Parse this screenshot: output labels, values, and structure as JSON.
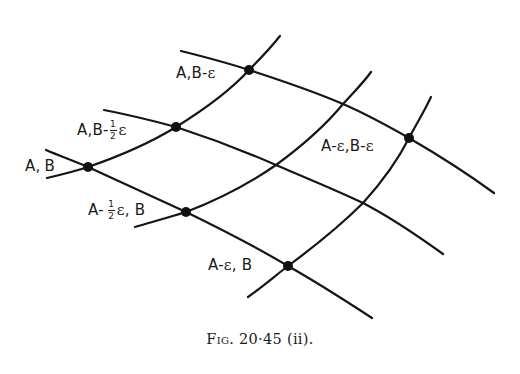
{
  "figure": {
    "caption_prefix": "Fig.",
    "caption_number": "20·45 (ii).",
    "caption_full": "Fig. 20·45 (ii).",
    "stroke_color": "#151515",
    "background_color": "#ffffff"
  },
  "labels": {
    "ab": {
      "a": "A",
      "sep": ",",
      "b": "B"
    },
    "ab_half_eps": {
      "prefix": "A,B-",
      "num": "1",
      "den": "2",
      "eps": "ε"
    },
    "ab_eps": {
      "prefix": "A,B-",
      "eps": "ε"
    },
    "a_half_eps_b": {
      "prefix": "A-",
      "num": "1",
      "den": "2",
      "eps": "ε",
      "suffix": ", B"
    },
    "a_eps_b": {
      "prefix": "A-",
      "eps": "ε",
      "suffix": ", B"
    },
    "a_eps_b_eps": {
      "prefix": "A-",
      "eps1": "ε",
      "mid": ",B-",
      "eps2": "ε"
    }
  },
  "points": [
    {
      "id": "A,B",
      "x": 88,
      "y": 167
    },
    {
      "id": "A,B-½ε",
      "x": 176,
      "y": 127
    },
    {
      "id": "A,B-ε",
      "x": 249,
      "y": 70
    },
    {
      "id": "A-½ε,B",
      "x": 186,
      "y": 212
    },
    {
      "id": "A-ε,B",
      "x": 288,
      "y": 266
    },
    {
      "id": "A-ε,B-ε",
      "x": 409,
      "y": 138
    }
  ],
  "curves": {
    "constant_A": [
      {
        "name": "A",
        "path": "M47,178 C 64,174 76,171 88,167 C 120,156 150,143 176,127 C 205,109 230,91 249,70 C 262,57 272,46 280,36"
      },
      {
        "name": "A-½ε",
        "path": "M135,227 C 152,222 170,217 186,212 C 220,199 250,183 276,165 C 302,146 325,126 343,104 C 354,92 364,82 371,72"
      },
      {
        "name": "A-ε",
        "path": "M248,297 C 262,287 275,276 288,266 C 315,246 341,225 363,203 C 382,182 398,160 409,138 C 417,123 425,110 431,97"
      }
    ],
    "constant_B": [
      {
        "name": "B-ε",
        "path": "M181,51 C 205,57 228,63 249,70 C 283,81 315,92 343,104 C 366,114 388,126 409,138 C 440,156 468,174 494,193"
      },
      {
        "name": "B-½ε",
        "path": "M104,110 C 130,115 154,121 176,127 C 210,138 244,151 276,165 C 306,178 336,190 363,203 C 392,218 418,236 443,254"
      },
      {
        "name": "B",
        "path": "M46,150 C 60,156 74,161 88,167 C 121,182 154,197 186,212 C 221,229 256,247 288,266 C 318,283 346,301 372,318"
      }
    ]
  }
}
